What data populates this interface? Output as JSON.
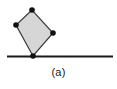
{
  "figure": {
    "caption": "(a)",
    "background_color": "#ffffff",
    "stroke_color": "#1a1a1a",
    "polygon_fill_color": "#d6d6d6",
    "polygon_stroke_color": "#3a3a3a",
    "vertex_color": "#111111",
    "baseline": {
      "label": "ground-line",
      "x1": 7,
      "y1": 56.5,
      "x2": 113,
      "y2": 56.5,
      "thickness": 2
    },
    "polygon": {
      "label": "quadrilateral-block",
      "sides": 4,
      "points": "32,10 16,25 33,56 53,33",
      "vertices": [
        {
          "name": "top",
          "x": 32,
          "y": 10
        },
        {
          "name": "left",
          "x": 16,
          "y": 25
        },
        {
          "name": "bottom-contact",
          "x": 33,
          "y": 56
        },
        {
          "name": "right",
          "x": 53,
          "y": 33
        }
      ],
      "vertex_radius": 2.8,
      "stroke_width": 1.2
    }
  }
}
